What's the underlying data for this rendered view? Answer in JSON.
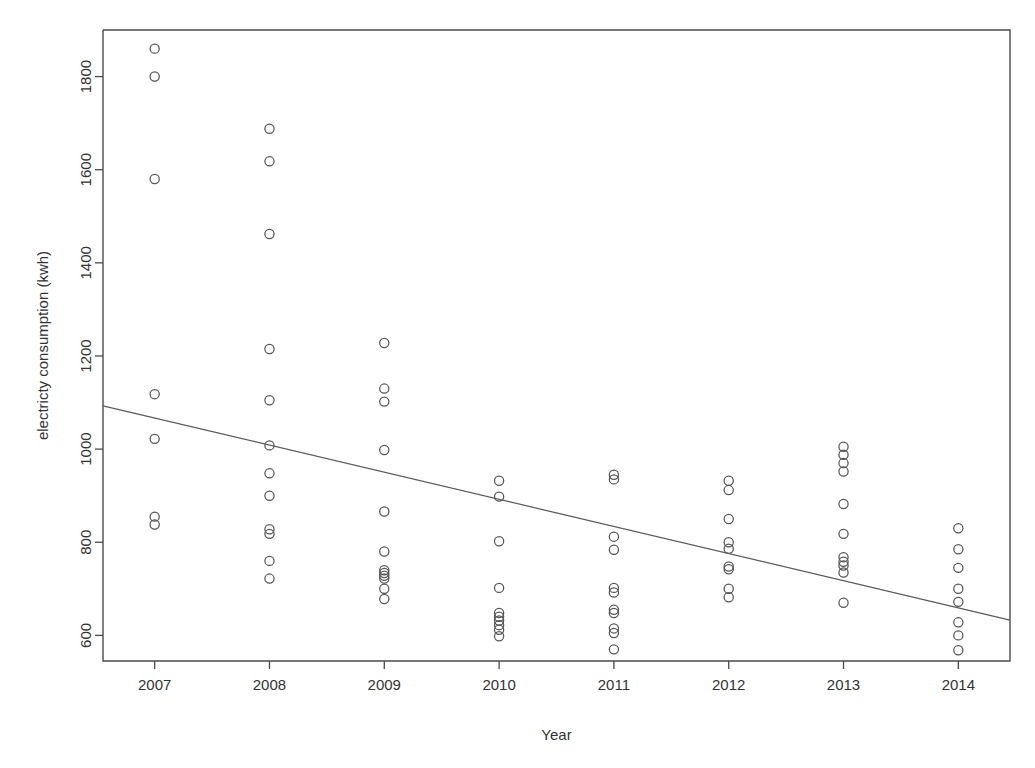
{
  "chart_data": {
    "type": "scatter",
    "title": "",
    "xlabel": "Year",
    "ylabel": "electricty consumption (kwh)",
    "xlim": [
      2006.55,
      2014.45
    ],
    "ylim": [
      545,
      1900
    ],
    "grid": false,
    "legend": "none",
    "x_ticks": [
      2007,
      2008,
      2009,
      2010,
      2011,
      2012,
      2013,
      2014
    ],
    "x_tick_labels": [
      "2007",
      "2008",
      "2009",
      "2010",
      "2011",
      "2012",
      "2013",
      "2014"
    ],
    "y_ticks": [
      600,
      800,
      1000,
      1200,
      1400,
      1600,
      1800
    ],
    "y_tick_labels": [
      "600",
      "800",
      "1000",
      "1200",
      "1400",
      "1600",
      "1800"
    ],
    "marker": "open-circle",
    "marker_color": "#555555",
    "series": [
      {
        "name": "electricity consumption",
        "points": [
          {
            "x": 2007,
            "y": 1860
          },
          {
            "x": 2007,
            "y": 1800
          },
          {
            "x": 2007,
            "y": 1580
          },
          {
            "x": 2007,
            "y": 1118
          },
          {
            "x": 2007,
            "y": 1022
          },
          {
            "x": 2007,
            "y": 855
          },
          {
            "x": 2007,
            "y": 838
          },
          {
            "x": 2008,
            "y": 1688
          },
          {
            "x": 2008,
            "y": 1618
          },
          {
            "x": 2008,
            "y": 1462
          },
          {
            "x": 2008,
            "y": 1215
          },
          {
            "x": 2008,
            "y": 1105
          },
          {
            "x": 2008,
            "y": 1008
          },
          {
            "x": 2008,
            "y": 948
          },
          {
            "x": 2008,
            "y": 900
          },
          {
            "x": 2008,
            "y": 828
          },
          {
            "x": 2008,
            "y": 818
          },
          {
            "x": 2008,
            "y": 760
          },
          {
            "x": 2008,
            "y": 722
          },
          {
            "x": 2009,
            "y": 1228
          },
          {
            "x": 2009,
            "y": 1130
          },
          {
            "x": 2009,
            "y": 1102
          },
          {
            "x": 2009,
            "y": 998
          },
          {
            "x": 2009,
            "y": 866
          },
          {
            "x": 2009,
            "y": 780
          },
          {
            "x": 2009,
            "y": 740
          },
          {
            "x": 2009,
            "y": 734
          },
          {
            "x": 2009,
            "y": 728
          },
          {
            "x": 2009,
            "y": 722
          },
          {
            "x": 2009,
            "y": 700
          },
          {
            "x": 2009,
            "y": 678
          },
          {
            "x": 2010,
            "y": 932
          },
          {
            "x": 2010,
            "y": 898
          },
          {
            "x": 2010,
            "y": 802
          },
          {
            "x": 2010,
            "y": 702
          },
          {
            "x": 2010,
            "y": 648
          },
          {
            "x": 2010,
            "y": 640
          },
          {
            "x": 2010,
            "y": 632
          },
          {
            "x": 2010,
            "y": 622
          },
          {
            "x": 2010,
            "y": 612
          },
          {
            "x": 2010,
            "y": 598
          },
          {
            "x": 2011,
            "y": 945
          },
          {
            "x": 2011,
            "y": 935
          },
          {
            "x": 2011,
            "y": 812
          },
          {
            "x": 2011,
            "y": 784
          },
          {
            "x": 2011,
            "y": 702
          },
          {
            "x": 2011,
            "y": 692
          },
          {
            "x": 2011,
            "y": 655
          },
          {
            "x": 2011,
            "y": 648
          },
          {
            "x": 2011,
            "y": 615
          },
          {
            "x": 2011,
            "y": 605
          },
          {
            "x": 2011,
            "y": 570
          },
          {
            "x": 2012,
            "y": 932
          },
          {
            "x": 2012,
            "y": 912
          },
          {
            "x": 2012,
            "y": 850
          },
          {
            "x": 2012,
            "y": 800
          },
          {
            "x": 2012,
            "y": 786
          },
          {
            "x": 2012,
            "y": 748
          },
          {
            "x": 2012,
            "y": 742
          },
          {
            "x": 2012,
            "y": 700
          },
          {
            "x": 2012,
            "y": 682
          },
          {
            "x": 2013,
            "y": 1005
          },
          {
            "x": 2013,
            "y": 988
          },
          {
            "x": 2013,
            "y": 970
          },
          {
            "x": 2013,
            "y": 952
          },
          {
            "x": 2013,
            "y": 882
          },
          {
            "x": 2013,
            "y": 818
          },
          {
            "x": 2013,
            "y": 768
          },
          {
            "x": 2013,
            "y": 758
          },
          {
            "x": 2013,
            "y": 750
          },
          {
            "x": 2013,
            "y": 735
          },
          {
            "x": 2013,
            "y": 670
          },
          {
            "x": 2014,
            "y": 830
          },
          {
            "x": 2014,
            "y": 785
          },
          {
            "x": 2014,
            "y": 745
          },
          {
            "x": 2014,
            "y": 700
          },
          {
            "x": 2014,
            "y": 672
          },
          {
            "x": 2014,
            "y": 628
          },
          {
            "x": 2014,
            "y": 600
          },
          {
            "x": 2014,
            "y": 568
          }
        ]
      }
    ],
    "trendline": {
      "name": "linear fit",
      "x_start": 2006.55,
      "y_start": 1093,
      "x_end": 2014.45,
      "y_end": 633,
      "color": "#5a5a5a"
    }
  }
}
